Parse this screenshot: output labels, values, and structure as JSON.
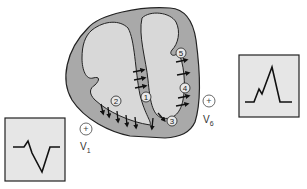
{
  "diagram": {
    "colors": {
      "myocardium": "#a9a9a9",
      "chamber": "#d8d8d8",
      "outline": "#222222",
      "box_fill": "#e6e6e6",
      "arrow": "#111111"
    },
    "sequence_markers": [
      {
        "label": "1",
        "location": "interventricular septum"
      },
      {
        "label": "2",
        "location": "right ventricular wall"
      },
      {
        "label": "3",
        "location": "apex"
      },
      {
        "label": "4",
        "location": "left ventricular free wall"
      },
      {
        "label": "5",
        "location": "left ventricular base"
      }
    ],
    "electrodes": [
      {
        "name": "V",
        "sub": "1",
        "symbol": "+"
      },
      {
        "name": "V",
        "sub": "6",
        "symbol": "+"
      }
    ],
    "ecg_tracings": [
      {
        "lead": "V1",
        "pattern": "rS (small r, deep S)"
      },
      {
        "lead": "V6",
        "pattern": "qR (small notch then tall R)"
      }
    ]
  }
}
